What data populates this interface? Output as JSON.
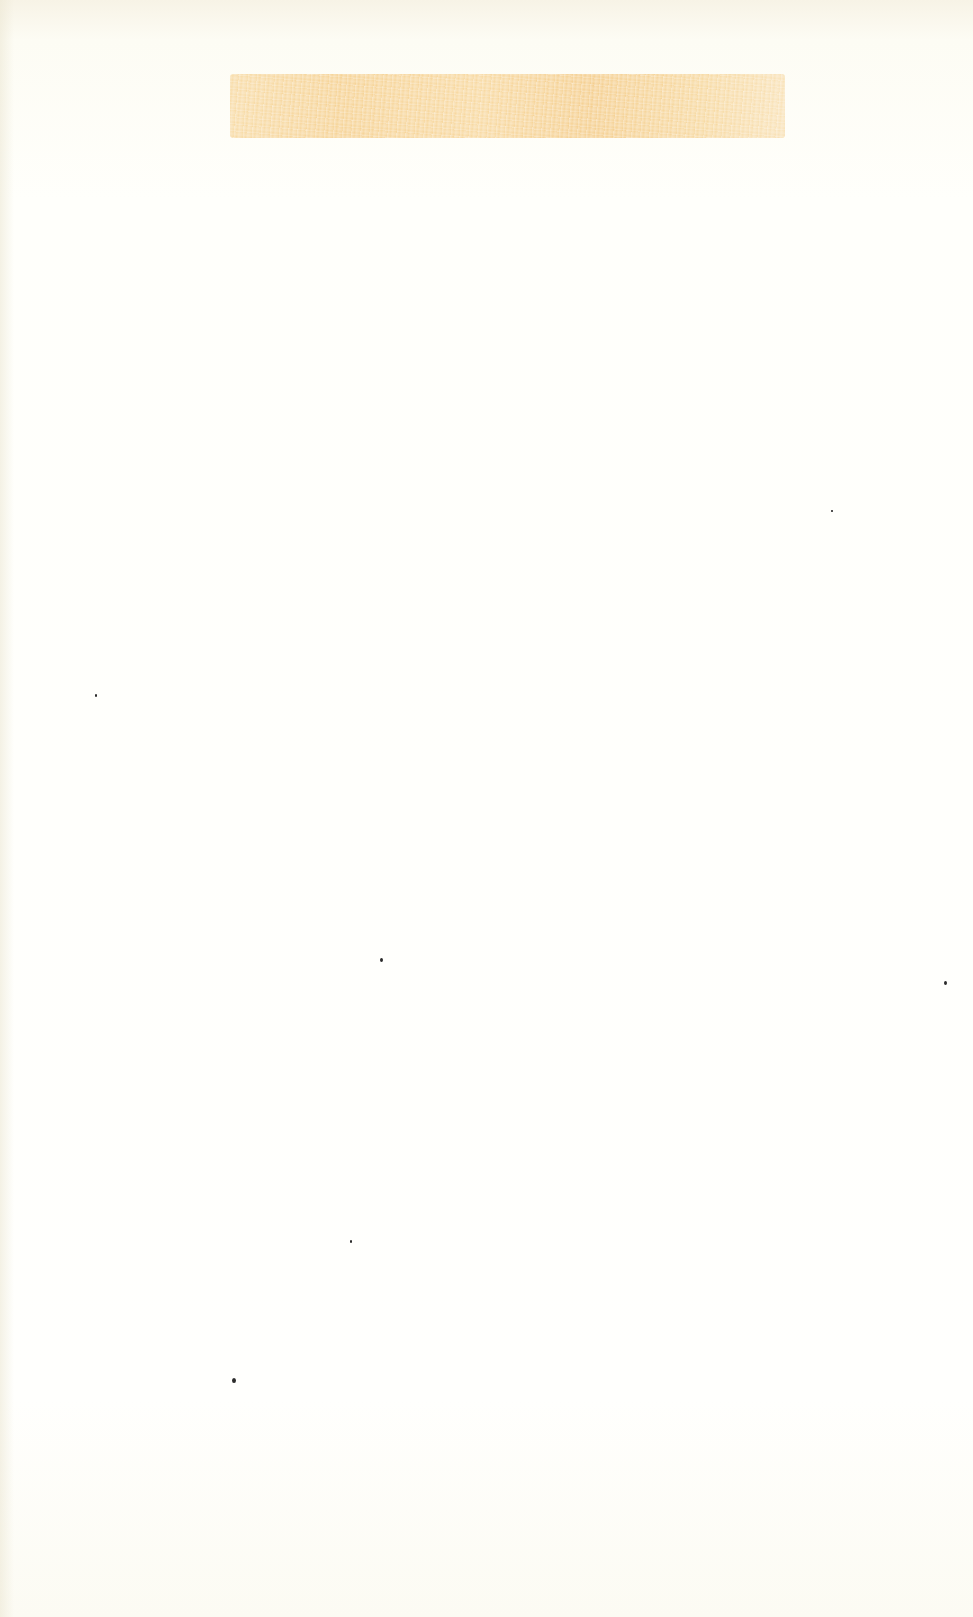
{
  "document": {
    "kind": "scanned blank paper sheet",
    "background_color": "#fefdf6",
    "highlight_band": {
      "color": "#f6cf8c",
      "text": ""
    },
    "specks": [
      {
        "x": 95,
        "y": 694,
        "size": 2
      },
      {
        "x": 380,
        "y": 958,
        "size": 3
      },
      {
        "x": 944,
        "y": 981,
        "size": 3
      },
      {
        "x": 350,
        "y": 1240,
        "size": 2
      },
      {
        "x": 232,
        "y": 1378,
        "size": 4
      },
      {
        "x": 831,
        "y": 510,
        "size": 1.5
      }
    ]
  }
}
